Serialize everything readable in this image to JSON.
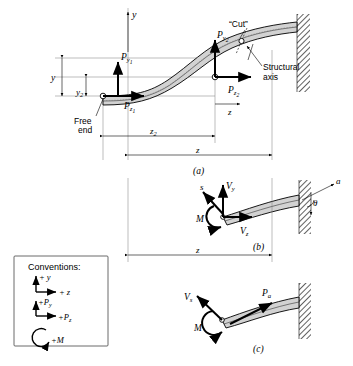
{
  "figure": {
    "panels": [
      {
        "id": "a",
        "label": "(a)"
      },
      {
        "id": "b",
        "label": "(b)"
      },
      {
        "id": "c",
        "label": "(c)"
      }
    ],
    "colors": {
      "beam_fill": "#d2d2d2",
      "outline": "#000000",
      "construction": "#7a7a7a",
      "wall_hatch": "#555555",
      "background": "#ffffff"
    }
  },
  "panel_a": {
    "axes": {
      "y_label": "y",
      "z_label": "z"
    },
    "forces": [
      {
        "name": "Py1",
        "base": "P",
        "sub": "y",
        "subsub": "1",
        "direction": "up"
      },
      {
        "name": "Pz1",
        "base": "P",
        "sub": "z",
        "subsub": "1",
        "direction": "right"
      },
      {
        "name": "Py2",
        "base": "P",
        "sub": "y",
        "subsub": "2",
        "direction": "up"
      },
      {
        "name": "Pz2",
        "base": "P",
        "sub": "z",
        "subsub": "2",
        "direction": "right-down"
      }
    ],
    "dimensions": [
      {
        "name": "y",
        "label": "y",
        "orientation": "vertical"
      },
      {
        "name": "y2",
        "base": "y",
        "sub": "2",
        "orientation": "vertical"
      },
      {
        "name": "z2",
        "base": "z",
        "sub": "2",
        "orientation": "horizontal"
      },
      {
        "name": "z",
        "base": "z",
        "sub": "",
        "orientation": "horizontal"
      }
    ],
    "annotations": [
      {
        "name": "free-end",
        "line1": "Free",
        "line2": "end"
      },
      {
        "name": "cut",
        "text": "“Cut”"
      },
      {
        "name": "structural-axis",
        "line1": "Structural",
        "line2": "axis"
      }
    ]
  },
  "panel_b": {
    "dimension": {
      "name": "z",
      "label": "z"
    },
    "forces": [
      {
        "name": "Vy",
        "base": "V",
        "sub": "y",
        "direction": "up"
      },
      {
        "name": "Vz",
        "base": "V",
        "sub": "z",
        "direction": "right"
      },
      {
        "name": "M",
        "base": "M",
        "sub": "",
        "direction": "moment"
      },
      {
        "name": "s",
        "base": "s",
        "sub": "",
        "direction": "up-left"
      }
    ],
    "angle": {
      "name": "theta",
      "label": "θ",
      "axis_label": "a"
    }
  },
  "panel_c": {
    "forces": [
      {
        "name": "Vs",
        "base": "V",
        "sub": "s",
        "direction": "up-left"
      },
      {
        "name": "Pa",
        "base": "P",
        "sub": "a",
        "direction": "up-right"
      },
      {
        "name": "M",
        "base": "M",
        "sub": "",
        "direction": "moment"
      }
    ]
  },
  "legend": {
    "title": "Conventions:",
    "items": [
      {
        "name": "axis-y",
        "label": "+ y"
      },
      {
        "name": "axis-z",
        "label": "+ z"
      },
      {
        "name": "force-Py",
        "base": "+P",
        "sub": "y"
      },
      {
        "name": "force-Pz",
        "base": "+P",
        "sub": "z"
      },
      {
        "name": "moment-M",
        "label": "+M"
      }
    ]
  }
}
